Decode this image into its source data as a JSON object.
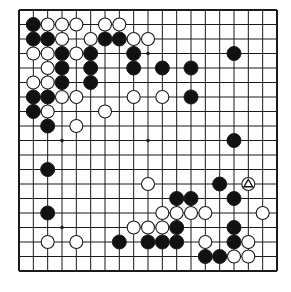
{
  "diagram": {
    "type": "go-board",
    "size": 19,
    "colors": {
      "background": "#ffffff",
      "line": "#1a1a1a",
      "black_stone": "#111111",
      "white_stone": "#ffffff",
      "stone_outline": "#1a1a1a"
    },
    "star_points": [
      [
        3,
        3
      ],
      [
        9,
        3
      ],
      [
        15,
        3
      ],
      [
        3,
        9
      ],
      [
        9,
        9
      ],
      [
        15,
        9
      ],
      [
        3,
        15
      ],
      [
        9,
        15
      ],
      [
        15,
        15
      ]
    ],
    "black_stones": [
      [
        1,
        1
      ],
      [
        1,
        2
      ],
      [
        2,
        2
      ],
      [
        6,
        2
      ],
      [
        7,
        2
      ],
      [
        3,
        3
      ],
      [
        5,
        3
      ],
      [
        8,
        3
      ],
      [
        15,
        3
      ],
      [
        3,
        4
      ],
      [
        5,
        4
      ],
      [
        8,
        4
      ],
      [
        10,
        4
      ],
      [
        12,
        4
      ],
      [
        3,
        5
      ],
      [
        5,
        5
      ],
      [
        1,
        6
      ],
      [
        2,
        6
      ],
      [
        12,
        6
      ],
      [
        1,
        7
      ],
      [
        2,
        8
      ],
      [
        15,
        9
      ],
      [
        2,
        11
      ],
      [
        14,
        12
      ],
      [
        11,
        13
      ],
      [
        12,
        13
      ],
      [
        15,
        13
      ],
      [
        2,
        14
      ],
      [
        11,
        15
      ],
      [
        15,
        15
      ],
      [
        7,
        16
      ],
      [
        9,
        16
      ],
      [
        10,
        16
      ],
      [
        11,
        16
      ],
      [
        15,
        16
      ],
      [
        13,
        17
      ],
      [
        14,
        17
      ]
    ],
    "white_stones": [
      [
        2,
        1
      ],
      [
        3,
        1
      ],
      [
        4,
        1
      ],
      [
        6,
        1
      ],
      [
        7,
        1
      ],
      [
        3,
        2
      ],
      [
        5,
        2
      ],
      [
        8,
        2
      ],
      [
        9,
        2
      ],
      [
        1,
        3
      ],
      [
        2,
        3
      ],
      [
        4,
        3
      ],
      [
        2,
        4
      ],
      [
        1,
        5
      ],
      [
        2,
        5
      ],
      [
        3,
        6
      ],
      [
        4,
        6
      ],
      [
        8,
        6
      ],
      [
        10,
        6
      ],
      [
        2,
        7
      ],
      [
        6,
        7
      ],
      [
        4,
        8
      ],
      [
        9,
        12
      ],
      [
        16,
        12
      ],
      [
        10,
        14
      ],
      [
        11,
        14
      ],
      [
        12,
        14
      ],
      [
        13,
        14
      ],
      [
        17,
        14
      ],
      [
        8,
        15
      ],
      [
        9,
        15
      ],
      [
        10,
        15
      ],
      [
        2,
        16
      ],
      [
        4,
        16
      ],
      [
        13,
        16
      ],
      [
        16,
        16
      ],
      [
        15,
        17
      ],
      [
        16,
        17
      ]
    ],
    "markers": [
      {
        "type": "triangle",
        "point": [
          16,
          12
        ],
        "on": "white"
      }
    ]
  }
}
